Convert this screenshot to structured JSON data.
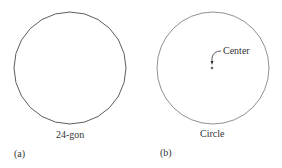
{
  "panels": [
    {
      "id": "a",
      "panel_label": "(a)",
      "shape_label": "24-gon",
      "sides": 24
    },
    {
      "id": "b",
      "panel_label": "(b)",
      "shape_label": "Circle",
      "annotation": "Center"
    }
  ],
  "colors": {
    "stroke": "#333333",
    "background": "#ffffff"
  }
}
